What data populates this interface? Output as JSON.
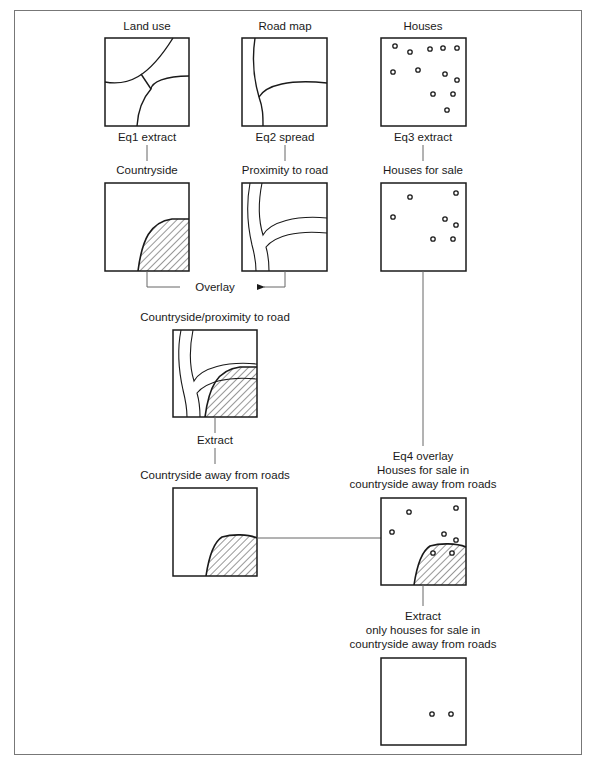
{
  "diagram": {
    "type": "gis-map-overlay-flowchart",
    "colors": {
      "line": "#1a1a1a",
      "frame": "#777777",
      "connector": "#666666",
      "background": "#ffffff"
    },
    "top_row": [
      {
        "title": "Land use",
        "operation": "Eq1 extract",
        "result": "Countryside"
      },
      {
        "title": "Road map",
        "operation": "Eq2 spread",
        "result": "Proximity to road"
      },
      {
        "title": "Houses",
        "operation": "Eq3 extract",
        "result": "Houses for sale"
      }
    ],
    "overlay_label": "Overlay",
    "combined": {
      "title": "Countryside/proximity to road",
      "operation": "Extract",
      "result": "Countryside away from roads"
    },
    "eq4": {
      "line1": "Eq4 overlay",
      "line2": "Houses for sale in",
      "line3": "countryside away from roads"
    },
    "final": {
      "line1": "Extract",
      "line2": "only houses for sale in",
      "line3": "countryside away from roads"
    },
    "houses_count": 12,
    "houses_for_sale_count": 7,
    "final_houses_count": 2
  }
}
